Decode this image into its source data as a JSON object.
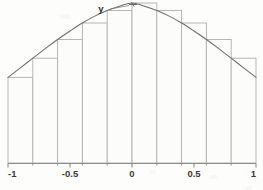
{
  "figure": {
    "name": "riemann-sum-bell-curve",
    "background_color": "#fdfdfc",
    "curve_color": "#6e6e6e",
    "bar_stroke_color": "#b4b4b4",
    "bar_fill_color": "#fcfcfb",
    "axis_color": "#8c8c8c",
    "label_color": "#3a3a3a"
  },
  "labels": {
    "curve": "y"
  },
  "chart_data": {
    "type": "area",
    "title": "",
    "subtitle": "",
    "xlabel": "",
    "ylabel": "",
    "xlim": [
      -1,
      1
    ],
    "ylim": [
      0,
      1
    ],
    "grid": false,
    "legend": "none",
    "annotations": [
      {
        "text": "y",
        "x": -0.22,
        "y": 0.98
      }
    ],
    "xticks": [
      -1,
      -0.5,
      0,
      0.5,
      1
    ],
    "xtick_labels": [
      "-1",
      "-0.5",
      "0",
      "0.5",
      "1"
    ],
    "yticks": [],
    "ytick_labels": [],
    "series": [
      {
        "name": "curve",
        "type": "line",
        "x": [
          -1.0,
          -0.9,
          -0.8,
          -0.7,
          -0.6,
          -0.5,
          -0.4,
          -0.3,
          -0.2,
          -0.1,
          0.0,
          0.1,
          0.2,
          0.3,
          0.4,
          0.5,
          0.6,
          0.7,
          0.8,
          0.9,
          1.0
        ],
        "values": [
          0.535,
          0.595,
          0.655,
          0.715,
          0.772,
          0.825,
          0.875,
          0.918,
          0.953,
          0.98,
          1.0,
          0.98,
          0.953,
          0.918,
          0.875,
          0.825,
          0.772,
          0.715,
          0.655,
          0.595,
          0.535
        ]
      },
      {
        "name": "riemann-rectangles",
        "type": "bar",
        "n": 10,
        "rule": "outer-endpoint",
        "bin_edges": [
          -1.0,
          -0.8,
          -0.6,
          -0.4,
          -0.2,
          0.0,
          0.2,
          0.4,
          0.6,
          0.8,
          1.0
        ],
        "categories": [
          "[-1.0,-0.8]",
          "[-0.8,-0.6]",
          "[-0.6,-0.4]",
          "[-0.4,-0.2]",
          "[-0.2,0.0]",
          "[0.0,0.2]",
          "[0.2,0.4]",
          "[0.4,0.6]",
          "[0.6,0.8]",
          "[0.8,1.0]"
        ],
        "values": [
          0.535,
          0.655,
          0.772,
          0.875,
          0.953,
          1.0,
          0.953,
          0.875,
          0.772,
          0.655
        ]
      }
    ]
  }
}
